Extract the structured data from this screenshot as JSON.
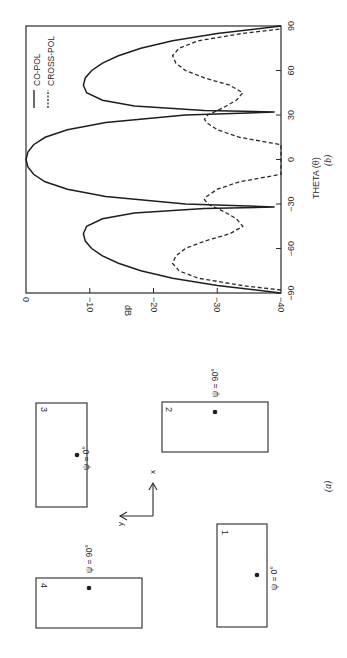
{
  "figure": {
    "orientation": "rotated 90 degrees counter-clockwise",
    "panel_a": {
      "caption": "(a)",
      "axes": {
        "x_label": "x",
        "y_label": "y"
      },
      "elements": [
        {
          "number": "1",
          "psi_label": "ψ = 0°"
        },
        {
          "number": "2",
          "psi_label": "ψ = 90°"
        },
        {
          "number": "3",
          "psi_label": "ψ = 0°"
        },
        {
          "number": "4",
          "psi_label": "ψ = 90°"
        }
      ]
    },
    "panel_b": {
      "caption": "(b)"
    }
  },
  "chart_data": {
    "type": "line",
    "title": "",
    "caption": "(b)",
    "xlabel": "THETA (θ)",
    "ylabel": "dB",
    "xlim": [
      -90,
      90
    ],
    "ylim": [
      -40,
      0
    ],
    "x_ticks": [
      "-90",
      "-60",
      "-30",
      "0",
      "30",
      "60",
      "90"
    ],
    "y_ticks": [
      "0",
      "-10",
      "-20",
      "-30",
      "-40"
    ],
    "grid": false,
    "legend": {
      "position": "upper right (in rotated frame)",
      "entries": [
        "CO-POL",
        "CROSS-POL"
      ]
    },
    "series": [
      {
        "name": "CO-POL",
        "style": "solid",
        "x": [
          -90,
          -85,
          -80,
          -75,
          -70,
          -65,
          -60,
          -55,
          -50,
          -45,
          -40,
          -36,
          -33,
          -32,
          -30,
          -25,
          -20,
          -15,
          -10,
          -5,
          0,
          5,
          10,
          15,
          20,
          25,
          30,
          32,
          33,
          36,
          40,
          45,
          50,
          55,
          60,
          65,
          70,
          75,
          80,
          85,
          90
        ],
        "values": [
          -40,
          -30,
          -23,
          -18,
          -14.5,
          -12,
          -10.3,
          -9.3,
          -9,
          -9.5,
          -12,
          -17,
          -28,
          -39,
          -25,
          -12.5,
          -6.5,
          -3,
          -1.2,
          -0.3,
          0,
          -0.3,
          -1.2,
          -3,
          -6.5,
          -12.5,
          -25,
          -39,
          -28,
          -17,
          -12,
          -9.5,
          -9,
          -9.3,
          -10.3,
          -12,
          -14.5,
          -18,
          -23,
          -30,
          -40
        ]
      },
      {
        "name": "CROSS-POL",
        "style": "dashed",
        "x": [
          -88,
          -85,
          -80,
          -75,
          -70,
          -65,
          -60,
          -55,
          -50,
          -45,
          -40,
          -35,
          -30,
          -27,
          -25,
          -20,
          -15,
          -10,
          10,
          15,
          20,
          25,
          27,
          30,
          35,
          40,
          45,
          50,
          55,
          60,
          65,
          70,
          75,
          80,
          85,
          88
        ],
        "values": [
          -40,
          -34,
          -27,
          -24,
          -23,
          -23.5,
          -25,
          -28,
          -32,
          -34,
          -33,
          -31,
          -28.5,
          -28,
          -28.3,
          -30,
          -33.5,
          -40,
          -40,
          -33.5,
          -30,
          -28.3,
          -28,
          -28.5,
          -31,
          -33,
          -34,
          -32,
          -28,
          -25,
          -23.5,
          -23,
          -24,
          -27,
          -34,
          -40
        ]
      }
    ]
  }
}
